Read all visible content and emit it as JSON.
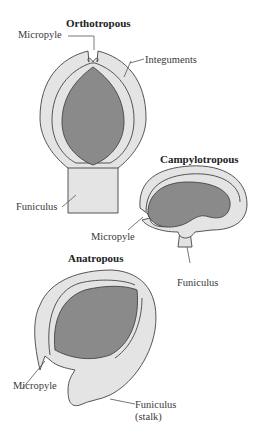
{
  "colors": {
    "integument_fill": "#e4e4e4",
    "nucellus_fill": "#8a8a8a",
    "outline": "#444444",
    "leader_line": "#555555",
    "background": "#ffffff"
  },
  "ovules": [
    {
      "type": "orthotropous",
      "title": "Orthotropous",
      "labels": {
        "micropyle": "Micropyle",
        "integuments": "Integuments",
        "funiculus": "Funiculus"
      }
    },
    {
      "type": "campylotropous",
      "title": "Campylotropous",
      "labels": {
        "micropyle": "Micropyle",
        "funiculus": "Funiculus"
      }
    },
    {
      "type": "anatropous",
      "title": "Anatropous",
      "labels": {
        "micropyle": "Micropyle",
        "funiculus_line1": "Funiculus",
        "funiculus_line2": "(stalk)"
      }
    }
  ]
}
